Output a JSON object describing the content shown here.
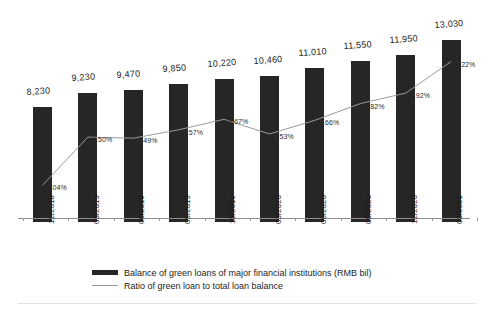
{
  "chart_data": {
    "type": "bar",
    "title": "",
    "subtitle": "",
    "xlabel": "",
    "ylabel": "",
    "grid": false,
    "legend_position": "bottom",
    "categories": [
      "12/2018",
      "03/2019",
      "06/2019",
      "09/2019",
      "12/2019",
      "03/2020",
      "06/2020",
      "09/2020",
      "12/2020",
      "03/2021"
    ],
    "series": [
      {
        "name": "Balance of green loans of major financial institutions (RMB bil)",
        "type": "bar",
        "axis": "left",
        "color": "#262626",
        "values": [
          8230,
          9230,
          9470,
          9850,
          10220,
          10460,
          11010,
          11550,
          11950,
          13030
        ],
        "labels": [
          "8,230",
          "9,230",
          "9,470",
          "9,850",
          "10,220",
          "10,460",
          "11,010",
          "11,550",
          "11,950",
          "13,030"
        ],
        "ylim": [
          0,
          13030
        ]
      },
      {
        "name": "Ratio of green loan to total loan balance",
        "type": "line",
        "axis": "right",
        "color": "#9b9b9b",
        "values": [
          6.04,
          6.5,
          6.49,
          6.57,
          6.67,
          6.53,
          6.66,
          6.82,
          6.92,
          7.22
        ],
        "labels": [
          "6.04%",
          "6.50%",
          "6.49%",
          "6.57%",
          "6.67%",
          "6.53%",
          "6.66%",
          "6.82%",
          "6.92%",
          "7.22%"
        ],
        "ylim": [
          5.9,
          7.35
        ]
      }
    ]
  },
  "legend": {
    "items": [
      {
        "label": "Balance of green loans of major financial institutions (RMB bil)",
        "marker": "bar-swatch"
      },
      {
        "label": "Ratio of green loan to total loan balance",
        "marker": "line-swatch"
      }
    ]
  }
}
